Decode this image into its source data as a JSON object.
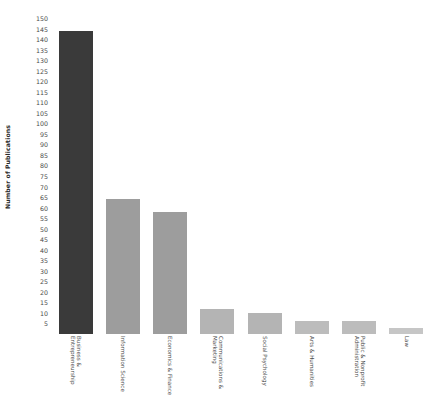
{
  "chart_data": {
    "type": "bar",
    "title": "",
    "xlabel": "",
    "ylabel": "Number of Publications",
    "ylim": [
      0,
      150
    ],
    "ytick_step": 5,
    "grid": false,
    "legend": "none",
    "categories": [
      "Business & Entrepreneurship",
      "Information Science",
      "Economics & Finance",
      "Communications & Marketing",
      "Social Psychology",
      "Arts & Humanities",
      "Public & Nonprofit Administration",
      "Law"
    ],
    "category_lines": [
      [
        "Business &",
        "Entrepreneurship"
      ],
      [
        "Information Science",
        ""
      ],
      [
        "Economics & Finance",
        ""
      ],
      [
        "Communications &",
        "Marketing"
      ],
      [
        "Social Psychology",
        ""
      ],
      [
        "Arts & Humanities",
        ""
      ],
      [
        "Public & Nonprofit",
        "Administration"
      ],
      [
        "Law",
        ""
      ]
    ],
    "values": [
      144,
      64,
      58,
      12,
      10,
      6,
      6,
      3
    ],
    "bar_colors": [
      "#3a3a3a",
      "#9d9d9d",
      "#9d9d9d",
      "#b4b4b4",
      "#b4b4b4",
      "#bcbcbc",
      "#bcbcbc",
      "#c6c6c6"
    ],
    "ytick_labels": [
      "150",
      "145",
      "140",
      "135",
      "130",
      "125",
      "120",
      "115",
      "110",
      "105",
      "100",
      "95",
      "90",
      "85",
      "80",
      "75",
      "70",
      "65",
      "60",
      "55",
      "50",
      "45",
      "40",
      "35",
      "30",
      "25",
      "20",
      "15",
      "10",
      "5"
    ],
    "ytick_values": [
      150,
      145,
      140,
      135,
      130,
      125,
      120,
      115,
      110,
      105,
      100,
      95,
      90,
      85,
      80,
      75,
      70,
      65,
      60,
      55,
      50,
      45,
      40,
      35,
      30,
      25,
      20,
      15,
      10,
      5
    ],
    "colors": {
      "highlight": "#3a3a3a",
      "default_bar": "#9d9d9d",
      "background": "#ffffff",
      "text": "#4a4a4a"
    }
  }
}
